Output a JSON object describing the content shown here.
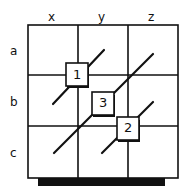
{
  "columns": [
    "x",
    "y",
    "z"
  ],
  "rows": [
    "a",
    "b",
    "c"
  ],
  "boxes": [
    {
      "label": "1",
      "cell": "x-a/b"
    },
    {
      "label": "2",
      "cell": "y-b/c"
    },
    {
      "label": "3",
      "cell": "y-b"
    }
  ],
  "colors": {
    "line": "#111111",
    "background": "#ffffff"
  }
}
